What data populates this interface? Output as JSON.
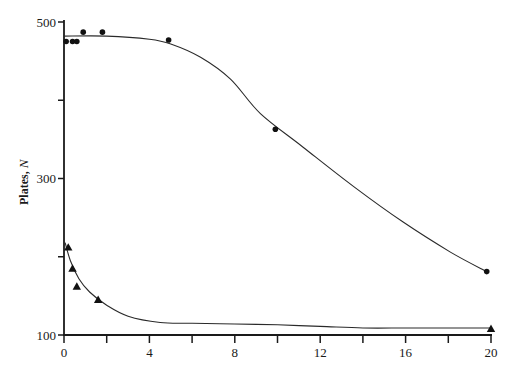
{
  "chart_data": {
    "type": "scatter",
    "title": "",
    "xlabel": "",
    "ylabel": "Plates, N",
    "ylabel_parts": {
      "text": "Plates, ",
      "italic": "N"
    },
    "xlim": [
      0,
      20
    ],
    "ylim": [
      100,
      500
    ],
    "x_ticks": [
      0,
      2,
      4,
      6,
      8,
      10,
      12,
      14,
      16,
      18,
      20
    ],
    "x_tick_labels": [
      "0",
      "",
      "4",
      "",
      "8",
      "",
      "12",
      "",
      "16",
      "",
      "20"
    ],
    "y_ticks": [
      100,
      200,
      300,
      400,
      500
    ],
    "y_tick_labels": [
      "100",
      "",
      "300",
      "",
      "500"
    ],
    "grid": false,
    "legend": null,
    "series": [
      {
        "name": "circles",
        "marker": "circle",
        "points": [
          {
            "x": 0.1,
            "y": 475
          },
          {
            "x": 0.4,
            "y": 475
          },
          {
            "x": 0.6,
            "y": 475
          },
          {
            "x": 0.9,
            "y": 487
          },
          {
            "x": 1.8,
            "y": 487
          },
          {
            "x": 4.9,
            "y": 477
          },
          {
            "x": 9.9,
            "y": 363
          },
          {
            "x": 19.8,
            "y": 181
          }
        ],
        "fit_curve": [
          {
            "x": 0,
            "y": 482
          },
          {
            "x": 2,
            "y": 482
          },
          {
            "x": 4,
            "y": 478
          },
          {
            "x": 5,
            "y": 472
          },
          {
            "x": 6.4,
            "y": 455
          },
          {
            "x": 7.8,
            "y": 427
          },
          {
            "x": 9.2,
            "y": 383
          },
          {
            "x": 11.2,
            "y": 340
          },
          {
            "x": 13.6,
            "y": 289
          },
          {
            "x": 15.9,
            "y": 244
          },
          {
            "x": 18.1,
            "y": 206
          },
          {
            "x": 19.8,
            "y": 181
          }
        ]
      },
      {
        "name": "triangles",
        "marker": "triangle",
        "points": [
          {
            "x": 0.2,
            "y": 212
          },
          {
            "x": 0.4,
            "y": 185
          },
          {
            "x": 0.6,
            "y": 162
          },
          {
            "x": 1.6,
            "y": 145
          },
          {
            "x": 20,
            "y": 108
          }
        ],
        "fit_curve": [
          {
            "x": 0.05,
            "y": 218
          },
          {
            "x": 0.3,
            "y": 195
          },
          {
            "x": 0.7,
            "y": 172
          },
          {
            "x": 1.2,
            "y": 155
          },
          {
            "x": 2,
            "y": 138
          },
          {
            "x": 3,
            "y": 124
          },
          {
            "x": 4.5,
            "y": 116
          },
          {
            "x": 6,
            "y": 115
          },
          {
            "x": 8,
            "y": 114
          },
          {
            "x": 10,
            "y": 113
          },
          {
            "x": 12,
            "y": 111
          },
          {
            "x": 14,
            "y": 109
          },
          {
            "x": 16,
            "y": 109
          },
          {
            "x": 18,
            "y": 109
          },
          {
            "x": 20,
            "y": 109
          }
        ]
      }
    ]
  },
  "style": {
    "ink": "#111111",
    "background": "#ffffff"
  }
}
